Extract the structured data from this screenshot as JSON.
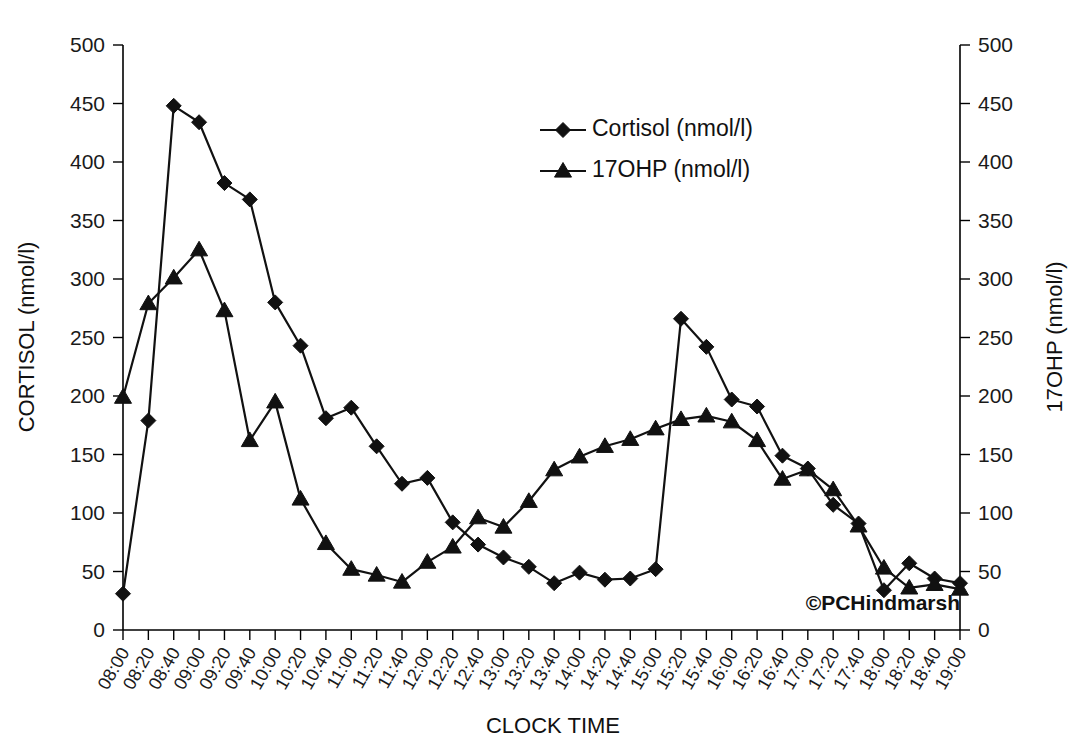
{
  "chart_data": {
    "type": "line",
    "title": "",
    "xlabel": "CLOCK TIME",
    "ylabel": "CORTISOL (nmol/l)",
    "y2label": "17OHP (nmol/l)",
    "ylim": [
      0,
      500
    ],
    "y2lim": [
      0,
      500
    ],
    "ytick_step": 50,
    "grid": false,
    "legend_position": "top-center",
    "watermark": "©PCHindmarsh",
    "yticks": [
      "0",
      "50",
      "100",
      "150",
      "200",
      "250",
      "300",
      "350",
      "400",
      "450",
      "500"
    ],
    "y2ticks": [
      "0",
      "50",
      "100",
      "150",
      "200",
      "250",
      "300",
      "350",
      "400",
      "450",
      "500"
    ],
    "categories": [
      "08:00",
      "08:20",
      "08:40",
      "09:00",
      "09:20",
      "09:40",
      "10:00",
      "10:20",
      "10:40",
      "11:00",
      "11:20",
      "11:40",
      "12:00",
      "12:20",
      "12:40",
      "13:00",
      "13:20",
      "13:40",
      "14:00",
      "14:20",
      "14:40",
      "15:00",
      "15:20",
      "15:40",
      "16:00",
      "16:20",
      "16:40",
      "17:00",
      "17:20",
      "17:40",
      "18:00",
      "18:20",
      "18:40",
      "19:00"
    ],
    "series": [
      {
        "name": "Cortisol (nmol/l)",
        "marker": "diamond",
        "axis": "left",
        "values": [
          31,
          179,
          448,
          434,
          382,
          368,
          280,
          243,
          181,
          190,
          157,
          125,
          130,
          92,
          73,
          62,
          54,
          40,
          49,
          43,
          44,
          52,
          266,
          242,
          197,
          191,
          149,
          138,
          107,
          91,
          34,
          57,
          44,
          40
        ]
      },
      {
        "name": "17OHP (nmol/l)",
        "marker": "triangle",
        "axis": "right",
        "values": [
          199,
          279,
          301,
          325,
          273,
          162,
          195,
          112,
          74,
          52,
          47,
          41,
          58,
          71,
          96,
          88,
          110,
          137,
          148,
          157,
          163,
          172,
          180,
          183,
          178,
          162,
          129,
          137,
          120,
          89,
          53,
          36,
          39,
          35
        ]
      }
    ]
  },
  "legend": {
    "items": [
      {
        "label": "Cortisol (nmol/l)",
        "marker": "diamond"
      },
      {
        "label": "17OHP (nmol/l)",
        "marker": "triangle"
      }
    ]
  },
  "axes": {
    "left_title": "CORTISOL (nmol/l)",
    "right_title": "17OHP (nmol/l)",
    "bottom_title": "CLOCK TIME"
  },
  "watermark": {
    "text": "©PCHindmarsh"
  }
}
